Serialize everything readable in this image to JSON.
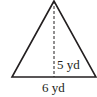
{
  "figure": {
    "shape": "isosceles-triangle",
    "stroke_color": "#231f20",
    "dash_color": "#231f20",
    "vertices": {
      "apex": [
        54,
        1
      ],
      "base_left": [
        12,
        77
      ],
      "base_right": [
        96,
        77
      ]
    },
    "altitude": {
      "x": 54,
      "y_top": 1,
      "y_bottom": 77,
      "style": "dashed"
    }
  },
  "labels": {
    "height": "5 yd",
    "base": "6 yd"
  }
}
